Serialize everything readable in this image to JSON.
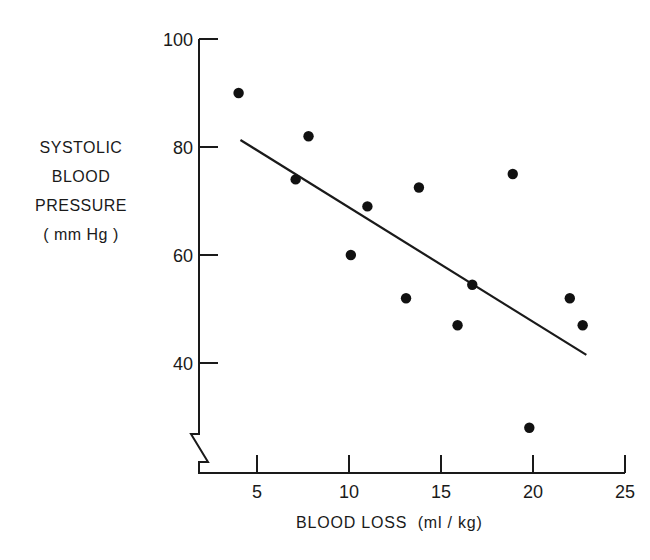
{
  "chart_data": {
    "type": "scatter",
    "title": "",
    "xlabel": "BLOOD LOSS (ml/kg)",
    "ylabel_lines": [
      "SYSTOLIC",
      "BLOOD",
      "PRESSURE",
      "(mm Hg)"
    ],
    "ylabel": "SYSTOLIC BLOOD PRESSURE (mm Hg)",
    "xlim": [
      0,
      25
    ],
    "ylim": [
      25,
      100
    ],
    "x_ticks": [
      5,
      10,
      15,
      20,
      25
    ],
    "y_ticks": [
      40,
      60,
      80,
      100
    ],
    "grid": false,
    "legend": null,
    "y_axis_break": true,
    "series": [
      {
        "name": "observations",
        "type": "scatter",
        "points": [
          {
            "x": 4.0,
            "y": 90
          },
          {
            "x": 7.1,
            "y": 74
          },
          {
            "x": 7.8,
            "y": 82
          },
          {
            "x": 10.1,
            "y": 60
          },
          {
            "x": 11.0,
            "y": 69
          },
          {
            "x": 13.1,
            "y": 52
          },
          {
            "x": 13.8,
            "y": 72.5
          },
          {
            "x": 15.9,
            "y": 47
          },
          {
            "x": 16.7,
            "y": 54.5
          },
          {
            "x": 18.9,
            "y": 75
          },
          {
            "x": 19.8,
            "y": 28
          },
          {
            "x": 22.0,
            "y": 52
          },
          {
            "x": 22.7,
            "y": 47
          }
        ]
      },
      {
        "name": "regression line",
        "type": "line",
        "points": [
          {
            "x": 4.1,
            "y": 81.3
          },
          {
            "x": 22.9,
            "y": 41.5
          }
        ]
      }
    ]
  },
  "labels": {
    "ylabel_lines": [
      "SYSTOLIC",
      "BLOOD",
      "PRESSURE",
      "( mm Hg )"
    ],
    "xlabel": "BLOOD LOSS  (ml / kg)"
  }
}
